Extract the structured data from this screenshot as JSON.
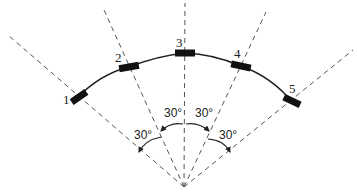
{
  "diagram": {
    "type": "sensor-arc-layout",
    "apex": {
      "x": 184,
      "y": 187
    },
    "line_color": "#555555",
    "arc_color": "#222222",
    "sensor_color": "#111111",
    "sensors": [
      {
        "label": "1",
        "x": 78,
        "y": 97,
        "angle": -60
      },
      {
        "label": "2",
        "x": 129,
        "y": 67,
        "angle": -30
      },
      {
        "label": "3",
        "x": 185,
        "y": 52,
        "angle": 0
      },
      {
        "label": "4",
        "x": 241,
        "y": 66,
        "angle": 30
      },
      {
        "label": "5",
        "x": 292,
        "y": 101,
        "angle": 60
      }
    ],
    "angle_labels": [
      {
        "text": "30°",
        "x": 134,
        "y": 139
      },
      {
        "text": "30°",
        "x": 164,
        "y": 117
      },
      {
        "text": "30°",
        "x": 195,
        "y": 117
      },
      {
        "text": "30°",
        "x": 219,
        "y": 139
      }
    ]
  }
}
